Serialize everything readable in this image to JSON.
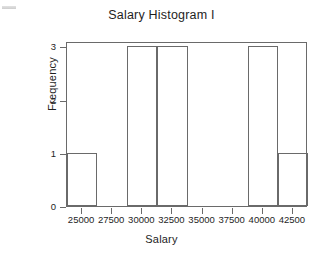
{
  "chart_data": {
    "type": "bar",
    "title": "Salary Histogram I",
    "xlabel": "Salary",
    "ylabel": "Frequency",
    "xlim": [
      23750,
      43750
    ],
    "ylim": [
      0,
      3.1
    ],
    "grid": false,
    "legend": "none",
    "bin_width": 2500,
    "xticks": [
      25000,
      27500,
      30000,
      32500,
      35000,
      37500,
      40000,
      42500
    ],
    "xtick_labels": [
      "25000",
      "27500",
      "30000",
      "32500",
      "35000",
      "37500",
      "40000",
      "42500"
    ],
    "yticks": [
      0,
      1,
      2,
      3
    ],
    "ytick_labels": [
      "0",
      "1",
      "2",
      "3"
    ],
    "bins": [
      {
        "left": 23750,
        "right": 26250,
        "value": 1
      },
      {
        "left": 26250,
        "right": 28750,
        "value": 0
      },
      {
        "left": 28750,
        "right": 31250,
        "value": 3
      },
      {
        "left": 31250,
        "right": 33750,
        "value": 3
      },
      {
        "left": 33750,
        "right": 36250,
        "value": 0
      },
      {
        "left": 36250,
        "right": 38750,
        "value": 0
      },
      {
        "left": 38750,
        "right": 41250,
        "value": 3
      },
      {
        "left": 41250,
        "right": 43750,
        "value": 1
      }
    ],
    "categories": [
      "23750-26250",
      "26250-28750",
      "28750-31250",
      "31250-33750",
      "33750-36250",
      "36250-38750",
      "38750-41250",
      "41250-43750"
    ],
    "values": [
      1,
      0,
      3,
      3,
      0,
      0,
      3,
      1
    ],
    "colors": {
      "bar_edge": "#6a6a6a",
      "bar_fill": "#ffffff",
      "axis": "#6a6a6a",
      "text": "#1e1e1e",
      "background": "#ffffff"
    }
  }
}
